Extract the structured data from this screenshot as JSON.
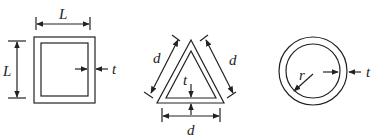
{
  "diagram": {
    "shapes": [
      {
        "name": "square-tube",
        "labels": {
          "side_horizontal": "L",
          "side_vertical": "L",
          "thickness": "t"
        }
      },
      {
        "name": "triangle-tube",
        "labels": {
          "side_left": "d",
          "side_right": "d",
          "side_bottom": "d",
          "thickness": "t"
        }
      },
      {
        "name": "circular-tube",
        "labels": {
          "radius": "r",
          "thickness": "t"
        }
      }
    ],
    "colors": {
      "stroke": "#222222",
      "background": "#ffffff"
    }
  }
}
